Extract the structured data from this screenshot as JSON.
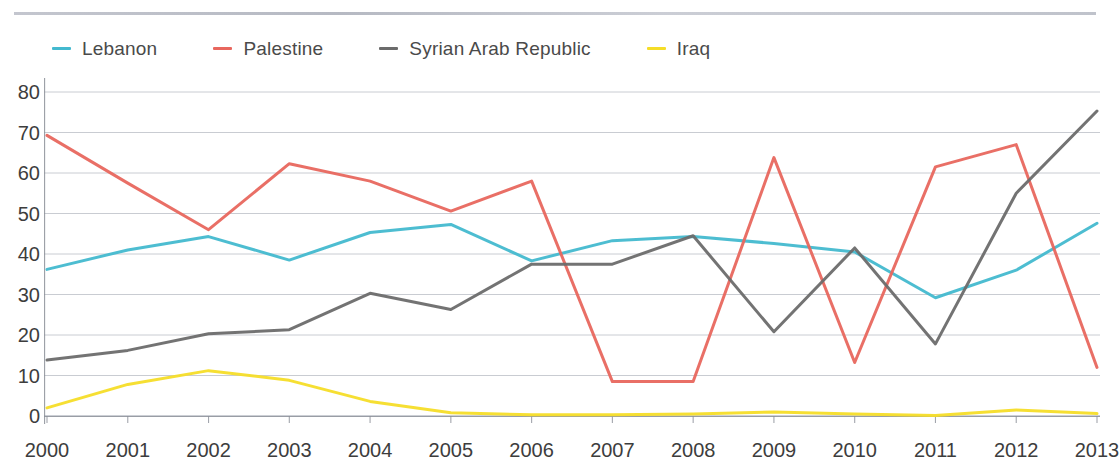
{
  "chart_data": {
    "type": "line",
    "title": "",
    "subtitle": "",
    "xlabel": "",
    "ylabel": "",
    "x": [
      "2000",
      "2001",
      "2002",
      "2003",
      "2004",
      "2005",
      "2006",
      "2007",
      "2008",
      "2009",
      "2010",
      "2011",
      "2012",
      "2013"
    ],
    "categories": [
      "2000",
      "2001",
      "2002",
      "2003",
      "2004",
      "2005",
      "2006",
      "2007",
      "2008",
      "2009",
      "2010",
      "2011",
      "2012",
      "2013"
    ],
    "xlim": [
      "2000",
      "2013"
    ],
    "ylim": [
      0,
      80
    ],
    "yticks": [
      0,
      10,
      20,
      30,
      40,
      50,
      60,
      70,
      80
    ],
    "ytick_labels": [
      "0",
      "10",
      "20",
      "30",
      "40",
      "50",
      "60",
      "70",
      "80"
    ],
    "grid": "horizontal",
    "legend_position": "top-left",
    "series": [
      {
        "name": "Lebanon",
        "color": "#43b9cf",
        "values": [
          36.2,
          41.0,
          44.3,
          38.5,
          45.3,
          47.3,
          38.3,
          43.3,
          44.3,
          42.6,
          40.5,
          29.2,
          36.0,
          47.6
        ]
      },
      {
        "name": "Palestine",
        "color": "#e8675e",
        "values": [
          69.3,
          57.5,
          46.0,
          62.3,
          58.0,
          50.6,
          58.0,
          8.5,
          8.5,
          63.8,
          13.2,
          61.5,
          67.0,
          12.0
        ]
      },
      {
        "name": "Syrian Arab Republic",
        "color": "#6b6b6b",
        "values": [
          13.8,
          16.2,
          20.3,
          21.3,
          30.3,
          26.3,
          37.5,
          37.5,
          44.5,
          20.8,
          41.5,
          17.8,
          55.0,
          75.3
        ]
      },
      {
        "name": "Iraq",
        "color": "#f5dd28",
        "values": [
          2.0,
          7.8,
          11.2,
          8.8,
          3.6,
          0.8,
          0.3,
          0.3,
          0.5,
          1.0,
          0.5,
          0.1,
          1.5,
          0.6
        ]
      }
    ]
  },
  "legend": {
    "items": [
      {
        "label": "Lebanon",
        "color": "#43b9cf",
        "swatch_name": "legend-swatch-lebanon"
      },
      {
        "label": "Palestine",
        "color": "#e8675e",
        "swatch_name": "legend-swatch-palestine"
      },
      {
        "label": "Syrian Arab Republic",
        "color": "#6b6b6b",
        "swatch_name": "legend-swatch-syrian-arab-republic"
      },
      {
        "label": "Iraq",
        "color": "#f5dd28",
        "swatch_name": "legend-swatch-iraq"
      }
    ]
  },
  "axes": {
    "y_tick_labels": [
      "80",
      "70",
      "60",
      "50",
      "40",
      "30",
      "20",
      "10",
      "0"
    ],
    "x_tick_labels": [
      "2000",
      "2001",
      "2002",
      "2003",
      "2004",
      "2005",
      "2006",
      "2007",
      "2008",
      "2009",
      "2010",
      "2011",
      "2012",
      "2013"
    ]
  },
  "colors": {
    "lebanon": "#43b9cf",
    "palestine": "#e8675e",
    "syria": "#6b6b6b",
    "iraq": "#f5dd28",
    "gridline": "#b8bcc4",
    "axis": "#8d919a",
    "text": "#3d3d3d",
    "background": "#ffffff"
  }
}
